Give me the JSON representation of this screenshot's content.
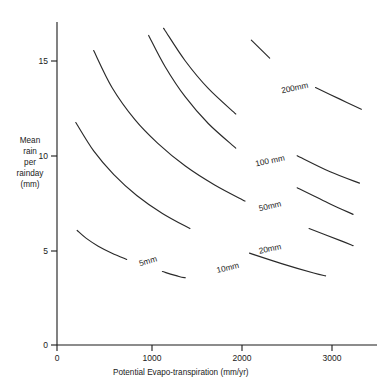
{
  "chart_data": {
    "type": "line",
    "title": "",
    "xlabel": "Potential  Evapo-transpiration (mm/yr)",
    "ylabel_lines": [
      "Mean",
      "rain",
      "per",
      "rainday",
      "(mm)"
    ],
    "ylabel": "Mean rain per rainday (mm)",
    "xlim": [
      0,
      3400
    ],
    "ylim": [
      0,
      17
    ],
    "xticks": [
      0,
      1000,
      2000,
      3000
    ],
    "xticklabels": [
      "0",
      "1000",
      "2000",
      "3000"
    ],
    "yticks": [
      0,
      5,
      10,
      15
    ],
    "yticklabels": [
      "0",
      "5",
      "10",
      "15"
    ],
    "grid": false,
    "legend": "none",
    "annotation_note": "Contour lines of constant runoff; each labelled in mm",
    "series": [
      {
        "name": "5mm",
        "label": "5mm",
        "label_position": {
          "x": 1000,
          "y": 4.45
        },
        "label_rotation": -16,
        "x": [
          220,
          320,
          450,
          600,
          760,
          950,
          1150,
          1330,
          1400
        ],
        "y": [
          6.05,
          5.63,
          5.22,
          4.85,
          4.52,
          4.18,
          3.88,
          3.62,
          3.55
        ]
      },
      {
        "name": "10mm",
        "label": "10mm",
        "label_position": {
          "x": 1870,
          "y": 4.1
        },
        "label_rotation": -13,
        "x": [
          205,
          400,
          620,
          870,
          1150,
          1450,
          1780,
          2100,
          2450,
          2800,
          2930
        ],
        "y": [
          11.75,
          10.25,
          9.0,
          7.9,
          6.95,
          6.15,
          5.45,
          4.85,
          4.3,
          3.8,
          3.65
        ]
      },
      {
        "name": "20mm",
        "label": "20mm",
        "label_position": {
          "x": 2330,
          "y": 5.1
        },
        "label_rotation": -12,
        "x": [
          400,
          600,
          850,
          1100,
          1400,
          1720,
          2050,
          2400,
          2750,
          3100,
          3230
        ],
        "y": [
          15.55,
          13.6,
          11.9,
          10.65,
          9.45,
          8.45,
          7.6,
          6.85,
          6.15,
          5.5,
          5.25
        ]
      },
      {
        "name": "50mm",
        "label": "50mm",
        "label_position": {
          "x": 2330,
          "y": 7.35
        },
        "label_rotation": -13,
        "x": [
          1000,
          1180,
          1400,
          1650,
          1950,
          2280,
          2620,
          2980,
          3230
        ],
        "y": [
          16.35,
          14.7,
          13.1,
          11.7,
          10.4,
          9.25,
          8.3,
          7.45,
          6.9
        ]
      },
      {
        "name": "100 mm",
        "label": "100 mm",
        "label_position": {
          "x": 2330,
          "y": 9.75
        },
        "label_rotation": -12,
        "x": [
          1000,
          1180,
          1400,
          1650,
          1950,
          2280,
          2620,
          2980,
          3300
        ],
        "y": [
          18.2,
          16.6,
          15.0,
          13.55,
          12.2,
          11.0,
          10.0,
          9.15,
          8.55
        ]
      },
      {
        "name": "200mm",
        "label": "200mm",
        "label_position": {
          "x": 2600,
          "y": 13.6
        },
        "label_rotation": -12,
        "x": [
          2120,
          2320,
          2560,
          2820,
          3080,
          3320
        ],
        "y": [
          16.1,
          15.15,
          14.3,
          13.6,
          13.0,
          12.45
        ]
      }
    ]
  }
}
